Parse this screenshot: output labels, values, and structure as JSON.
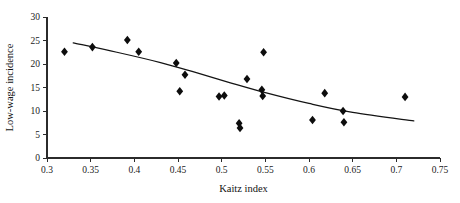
{
  "chart_data": {
    "type": "scatter",
    "title": "",
    "xlabel": "Kaitz index",
    "ylabel": "Low-wage incidence",
    "xlim": [
      0.3,
      0.75
    ],
    "ylim": [
      0,
      30
    ],
    "grid": false,
    "legend": "none",
    "xticks": [
      0.3,
      0.35,
      0.4,
      0.45,
      0.5,
      0.55,
      0.6,
      0.65,
      0.7,
      0.75
    ],
    "xtick_labels": [
      "0.3",
      "0.35",
      "0.4",
      "0.45",
      "0.5",
      "0.55",
      "0.6",
      "0.65",
      "0.7",
      "0.75"
    ],
    "yticks": [
      0,
      5,
      10,
      15,
      20,
      25,
      30
    ],
    "ytick_labels": [
      "0",
      "5",
      "10",
      "15",
      "20",
      "25",
      "30"
    ],
    "marker_style": "filled-diamond",
    "marker_color": "#0d0d0d",
    "points": [
      {
        "x": 0.32,
        "y": 22.6
      },
      {
        "x": 0.352,
        "y": 23.6
      },
      {
        "x": 0.392,
        "y": 25.1
      },
      {
        "x": 0.405,
        "y": 22.6
      },
      {
        "x": 0.448,
        "y": 20.2
      },
      {
        "x": 0.452,
        "y": 14.2
      },
      {
        "x": 0.458,
        "y": 17.7
      },
      {
        "x": 0.497,
        "y": 13.1
      },
      {
        "x": 0.503,
        "y": 13.3
      },
      {
        "x": 0.52,
        "y": 7.4
      },
      {
        "x": 0.521,
        "y": 6.4
      },
      {
        "x": 0.529,
        "y": 16.8
      },
      {
        "x": 0.548,
        "y": 22.5
      },
      {
        "x": 0.546,
        "y": 14.5
      },
      {
        "x": 0.547,
        "y": 13.2
      },
      {
        "x": 0.604,
        "y": 8.1
      },
      {
        "x": 0.618,
        "y": 13.8
      },
      {
        "x": 0.639,
        "y": 10.0
      },
      {
        "x": 0.64,
        "y": 7.6
      },
      {
        "x": 0.71,
        "y": 13.0
      }
    ],
    "trend_line": {
      "description": "fitted downward-sloping curve",
      "color": "#141414",
      "points": [
        {
          "x": 0.33,
          "y": 24.5
        },
        {
          "x": 0.38,
          "y": 22.5
        },
        {
          "x": 0.43,
          "y": 20.3
        },
        {
          "x": 0.47,
          "y": 18.2
        },
        {
          "x": 0.51,
          "y": 16.0
        },
        {
          "x": 0.55,
          "y": 13.9
        },
        {
          "x": 0.6,
          "y": 11.6
        },
        {
          "x": 0.65,
          "y": 9.7
        },
        {
          "x": 0.72,
          "y": 7.9
        }
      ]
    }
  }
}
